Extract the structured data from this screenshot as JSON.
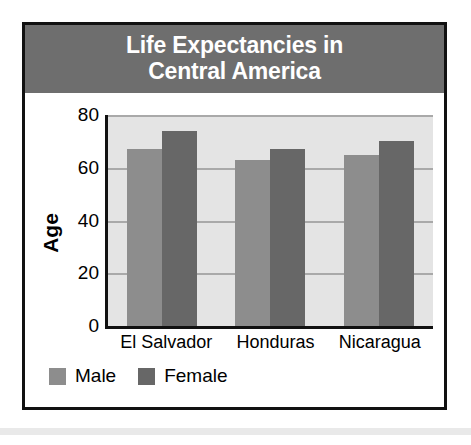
{
  "chart_data": {
    "type": "bar",
    "title": "Life Expectancies in\nCentral America",
    "title_line1": "Life Expectancies in",
    "title_line2": "Central America",
    "xlabel": "",
    "ylabel": "Age",
    "ylim": [
      0,
      80
    ],
    "yticks": [
      0,
      20,
      40,
      60,
      80
    ],
    "grid": true,
    "legend_position": "bottom-left",
    "categories": [
      "El Salvador",
      "Honduras",
      "Nicaragua"
    ],
    "series": [
      {
        "name": "Male",
        "color": "#8d8d8d",
        "values": [
          67,
          63,
          65
        ]
      },
      {
        "name": "Female",
        "color": "#676767",
        "values": [
          74,
          67,
          70
        ]
      }
    ]
  },
  "colors": {
    "title_band": "#6e6e6e",
    "title_text": "#ffffff",
    "plot_background": "#e4e4e4",
    "gridline": "#a9a9a9",
    "axis": "#111111",
    "border": "#111111",
    "male": "#8d8d8d",
    "female": "#676767"
  }
}
